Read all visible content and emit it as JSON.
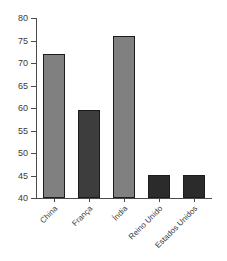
{
  "top_clipped_caption": "",
  "chart_data": {
    "type": "bar",
    "title": "",
    "subtitle": "",
    "xlabel": "",
    "ylabel": "",
    "categories": [
      "China",
      "França",
      "Índia",
      "Reino Unido",
      "Estados Unidos"
    ],
    "values": [
      72,
      59.6,
      76,
      45.1,
      45.1
    ],
    "bar_colors": [
      "#808080",
      "#3d3d3d",
      "#808080",
      "#2b2b2b",
      "#2b2b2b"
    ],
    "bar_edge_color": "#1c1c1c",
    "ylim": [
      40,
      80
    ],
    "ytick_values": [
      40,
      45,
      50,
      55,
      60,
      65,
      70,
      75,
      80
    ],
    "ytick_labels": [
      "40",
      "45",
      "50",
      "55",
      "60",
      "65",
      "70",
      "75",
      "80"
    ],
    "grid": false,
    "legend": false,
    "legend_position": "none",
    "xtick_label_rotation": -45,
    "background_color": "#ffffff",
    "axis_color": "#4a4a4a"
  }
}
